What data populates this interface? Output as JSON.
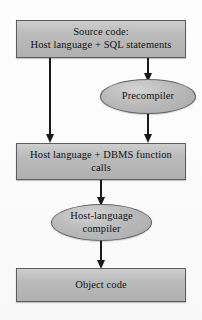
{
  "diagram": {
    "type": "flowchart",
    "colors": {
      "box_fill": "#b9b9b9",
      "ellipse_fill": "#b4b4b4",
      "border": "#5d5d5d",
      "arrow": "#1a1a1a",
      "text": "#131313",
      "page_background": "#fefefe"
    },
    "nodes": [
      {
        "id": "source-code",
        "shape": "rectangle",
        "label": "Source code:\nHost language + SQL statements"
      },
      {
        "id": "precompiler",
        "shape": "ellipse",
        "label": "Precompiler"
      },
      {
        "id": "host-dbms-calls",
        "shape": "rectangle",
        "label": "Host language + DBMS function\ncalls"
      },
      {
        "id": "host-language-compiler",
        "shape": "ellipse",
        "label": "Host-language\ncompiler"
      },
      {
        "id": "object-code",
        "shape": "rectangle",
        "label": "Object code"
      }
    ],
    "edges": [
      {
        "id": "edge-source-to-calls",
        "from": "source-code",
        "to": "host-dbms-calls",
        "arrowhead": "filled-triangle"
      },
      {
        "id": "edge-source-to-precompiler",
        "from": "source-code",
        "to": "precompiler",
        "arrowhead": "filled-triangle"
      },
      {
        "id": "edge-precompiler-to-calls",
        "from": "precompiler",
        "to": "host-dbms-calls",
        "arrowhead": "filled-triangle"
      },
      {
        "id": "edge-calls-to-compiler",
        "from": "host-dbms-calls",
        "to": "host-language-compiler",
        "arrowhead": "filled-triangle"
      },
      {
        "id": "edge-compiler-to-object",
        "from": "host-language-compiler",
        "to": "object-code",
        "arrowhead": "filled-triangle"
      }
    ]
  }
}
